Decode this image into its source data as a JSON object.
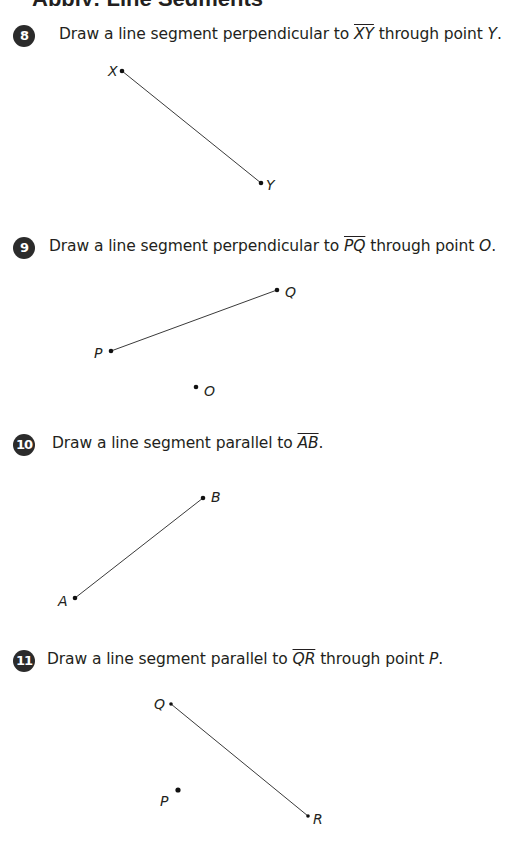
{
  "header": {
    "text": "Apply: Line Segments"
  },
  "problems": [
    {
      "number": "8",
      "text_before": "Draw a line segment perpendicular to ",
      "segment": "XY",
      "text_after": " through point ",
      "point": "Y",
      "text_end": ".",
      "points": {
        "p1": {
          "label": "X",
          "x": 122,
          "y": 71
        },
        "p2": {
          "label": "Y",
          "x": 261,
          "y": 183
        }
      }
    },
    {
      "number": "9",
      "text_before": "Draw a line segment perpendicular to ",
      "segment": "PQ",
      "text_after": " through point ",
      "point": "O",
      "text_end": ".",
      "points": {
        "p1": {
          "label": "P",
          "x": 111,
          "y": 351
        },
        "p2": {
          "label": "Q",
          "x": 277,
          "y": 290
        },
        "extra": {
          "label": "O",
          "x": 196,
          "y": 387
        }
      }
    },
    {
      "number": "10",
      "text_before": "Draw a line segment parallel to ",
      "segment": "AB",
      "text_after": "",
      "point": "",
      "text_end": ".",
      "points": {
        "p1": {
          "label": "A",
          "x": 75,
          "y": 598
        },
        "p2": {
          "label": "B",
          "x": 203,
          "y": 498
        }
      }
    },
    {
      "number": "11",
      "text_before": "Draw a line segment parallel to ",
      "segment": "QR",
      "text_after": "  through point ",
      "point": "P",
      "text_end": ".",
      "points": {
        "p1": {
          "label": "Q",
          "x": 171,
          "y": 704
        },
        "p2": {
          "label": "R",
          "x": 308,
          "y": 816
        },
        "extra": {
          "label": "P",
          "x": 178,
          "y": 790
        }
      }
    }
  ]
}
